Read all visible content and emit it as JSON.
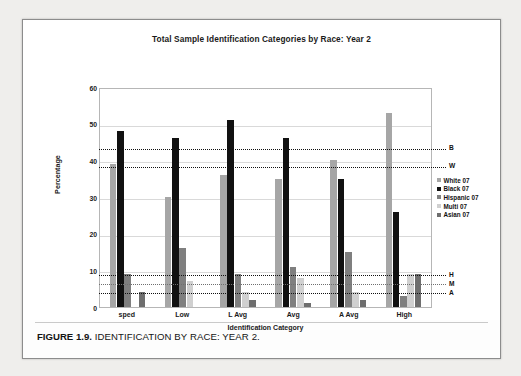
{
  "caption": {
    "figure_number": "FIGURE 1.9.",
    "text": " IDENTIFICATION BY RACE: YEAR 2."
  },
  "chart_data": {
    "type": "bar",
    "title": "Total Sample Identification Categories by Race: Year 2",
    "xlabel": "Identification Category",
    "ylabel": "Percentage",
    "ylim": [
      0,
      60
    ],
    "yticks": [
      "0",
      "10",
      "20",
      "30",
      "40",
      "50",
      "60"
    ],
    "grid": true,
    "legend_position": "right",
    "categories": [
      "sped",
      "Low",
      "L Avg",
      "Avg",
      "A Avg",
      "High"
    ],
    "series": [
      {
        "name": "White 07",
        "color": "#a6a6a6",
        "values": [
          39,
          30,
          36,
          35,
          40,
          53
        ]
      },
      {
        "name": "Black 07",
        "color": "#111111",
        "values": [
          48,
          46,
          51,
          46,
          35,
          26
        ]
      },
      {
        "name": "Hispanic 07",
        "color": "#7f7f7f",
        "values": [
          9,
          16,
          9,
          11,
          15,
          3
        ]
      },
      {
        "name": "Multi 07",
        "color": "#d0d0d0",
        "values": [
          0,
          7,
          4,
          8,
          4,
          9
        ]
      },
      {
        "name": "Asian 07",
        "color": "#6e6e6e",
        "values": [
          4,
          0,
          2,
          1,
          2,
          9
        ]
      }
    ],
    "reference_lines": [
      {
        "label": "B",
        "value": 43.5
      },
      {
        "label": "W",
        "value": 38.5
      },
      {
        "label": "H",
        "value": 9.0
      },
      {
        "label": "M",
        "value": 6.5
      },
      {
        "label": "A",
        "value": 4.0
      }
    ]
  }
}
